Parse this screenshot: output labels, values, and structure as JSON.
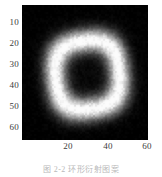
{
  "figure": {
    "caption": "图 2-2  环形衍射图案",
    "background_color": "#ffffff",
    "tick_color": "#3c3c3c",
    "caption_color": "#b9b9b9"
  },
  "chart_data": {
    "type": "heatmap",
    "title": "",
    "xlabel": "",
    "ylabel": "",
    "colormap": "gray",
    "grid": false,
    "legend": "none",
    "origin": "upper",
    "xlim": [
      0,
      64
    ],
    "ylim": [
      64,
      0
    ],
    "xticks": [
      20,
      40,
      60
    ],
    "yticks": [
      10,
      20,
      30,
      40,
      50,
      60
    ],
    "xticklabels": [
      "20",
      "40",
      "60"
    ],
    "yticklabels": [
      "10",
      "20",
      "30",
      "40",
      "50",
      "60"
    ],
    "vmin": 0,
    "vmax": 1,
    "pattern": {
      "shape": "annulus",
      "description": "Bright circular ring (donut) with dark center and dark corners; speckle noise over dark regions.",
      "center_x": 33,
      "center_y": 33,
      "ring_radius": 17,
      "ring_width": 7,
      "ring_peak_intensity": 1.0,
      "center_intensity": 0.06,
      "background_intensity": 0.05,
      "noise_amplitude": 0.06,
      "grid_size": 64
    },
    "profile_samples": {
      "note": "Radial intensity profile, r in pixels from center to value 0-1",
      "r": [
        0,
        2,
        4,
        6,
        8,
        10,
        12,
        14,
        16,
        17,
        18,
        20,
        22,
        24,
        26,
        28,
        30,
        32
      ],
      "intensity": [
        0.05,
        0.06,
        0.07,
        0.09,
        0.14,
        0.26,
        0.5,
        0.8,
        0.97,
        1.0,
        0.97,
        0.78,
        0.47,
        0.26,
        0.14,
        0.09,
        0.07,
        0.05
      ]
    }
  },
  "axes": {
    "y_ticks": [
      {
        "label": "10",
        "top": 22
      },
      {
        "label": "20",
        "top": 43
      },
      {
        "label": "30",
        "top": 64
      },
      {
        "label": "40",
        "top": 85
      },
      {
        "label": "50",
        "top": 106
      },
      {
        "label": "60",
        "top": 127
      }
    ],
    "x_ticks": [
      {
        "label": "20",
        "left": 68
      },
      {
        "label": "40",
        "left": 108
      },
      {
        "label": "60",
        "left": 147
      }
    ]
  }
}
